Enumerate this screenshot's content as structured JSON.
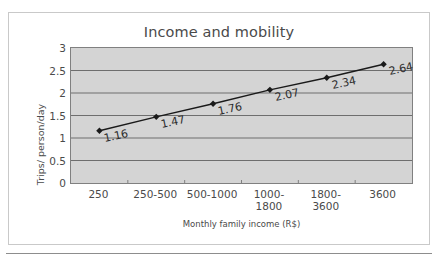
{
  "chart_data": {
    "type": "line",
    "title": "Income and mobility",
    "xlabel": "Monthly family income (R$)",
    "ylabel": "Trips/ person/day",
    "categories": [
      "250",
      "250-500",
      "500-1000",
      "1000-1800",
      "1800-3600",
      "3600"
    ],
    "values": [
      1.16,
      1.47,
      1.76,
      2.07,
      2.34,
      2.64
    ],
    "point_labels": [
      "1.16",
      "1.47",
      "1.76",
      "2.07",
      "2.34",
      "2.64"
    ],
    "ylim": [
      0,
      3
    ],
    "ytick_labels": [
      "3",
      "2.5",
      "2",
      "1.5",
      "1",
      "0.5",
      "0"
    ],
    "ytick_values": [
      3,
      2.5,
      2,
      1.5,
      1,
      0.5,
      0
    ],
    "grid": true,
    "grid_axis": "y",
    "legend": false,
    "series_name": "Trips/ person/day",
    "marker": "diamond",
    "colors": {
      "plot_background": "#d4d4d4",
      "page_background": "#ffffff",
      "line": "#1a1a1a",
      "marker": "#1a1a1a",
      "gridline": "#6e6e6e",
      "axis": "#808080",
      "text": "#4a4a4a",
      "frame_border": "#c9c9c9"
    }
  }
}
